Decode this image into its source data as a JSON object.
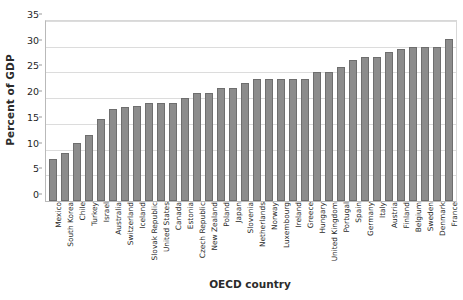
{
  "chart_data": {
    "type": "bar",
    "title": "",
    "xlabel": "OECD country",
    "ylabel": "Percent of GDP",
    "ylim": [
      0,
      35
    ],
    "ytick_values": [
      0,
      5,
      10,
      15,
      20,
      25,
      30,
      35
    ],
    "ytick_labels": [
      "0",
      "5",
      "10",
      "15",
      "20",
      "25",
      "30",
      "35"
    ],
    "grid": true,
    "legend": "none",
    "bar_color": "#8c8c8c",
    "bar_edge_color": "#6e6e6e",
    "categories": [
      "Mexico",
      "South Korea",
      "Chile",
      "Turkey",
      "Israel",
      "Australia",
      "Switzerland",
      "Iceland",
      "Slovak Republic",
      "United States",
      "Canada",
      "Estonia",
      "Czech Republic",
      "New Zealand",
      "Poland",
      "Japan",
      "Slovenia",
      "Netherlands",
      "Norway",
      "Luxembourg",
      "Ireland",
      "Greece",
      "Hungary",
      "United Kingdom",
      "Portugal",
      "Spain",
      "Germany",
      "Italy",
      "Austria",
      "Finland",
      "Belgium",
      "Sweden",
      "Denmark",
      "France"
    ],
    "values": [
      8.2,
      9.4,
      11.2,
      12.8,
      15.9,
      17.8,
      18.3,
      18.5,
      19.0,
      19.0,
      19.0,
      20.0,
      21.0,
      21.0,
      22.0,
      22.0,
      23.0,
      23.8,
      23.8,
      23.8,
      23.8,
      23.8,
      25.0,
      25.0,
      26.0,
      27.5,
      28.0,
      28.0,
      29.0,
      29.5,
      30.0,
      30.0,
      30.0,
      31.5
    ]
  }
}
